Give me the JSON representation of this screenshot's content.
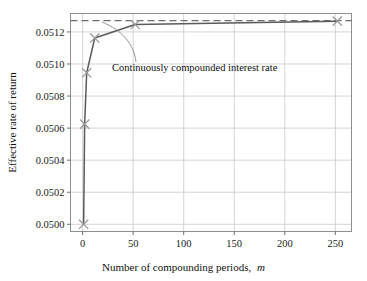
{
  "chart_data": {
    "type": "line",
    "title": "",
    "xlabel": "Number of compounding periods, m",
    "xlabel_main": "Number of compounding periods,",
    "xlabel_italic": "m",
    "ylabel": "Effective rate of return",
    "xlim": [
      -12,
      266
    ],
    "ylim": [
      0.049955,
      0.051315
    ],
    "grid": true,
    "legend": "none",
    "xticks": [
      0,
      50,
      100,
      150,
      200,
      250
    ],
    "xticklabels": [
      "0",
      "50",
      "100",
      "150",
      "200",
      "250"
    ],
    "yticks": [
      0.05,
      0.0502,
      0.0504,
      0.0506,
      0.0508,
      0.051,
      0.0512
    ],
    "yticklabels": [
      "0.0500",
      "0.0502",
      "0.0504",
      "0.0506",
      "0.0508",
      "0.0510",
      "0.0512"
    ],
    "series": [
      {
        "name": "Effective rate of return",
        "marker": "x",
        "x": [
          1,
          2,
          4,
          12,
          52,
          252
        ],
        "values": [
          0.05,
          0.050625,
          0.050945,
          0.051162,
          0.051246,
          0.0512674
        ]
      }
    ],
    "reference_line": {
      "name": "Continuously compounded interest rate",
      "style": "dashed",
      "y": 0.0512711
    },
    "annotations": [
      {
        "text": "Continuously compounded interest rate",
        "x": 33,
        "y": 0.051038
      }
    ],
    "colors": {
      "line": "#5a5a5a",
      "marker": "#9a9a9a",
      "dashed": "#6d6d6d",
      "grid": "#c9c9c9",
      "frame": "#8f8f8f",
      "text": "#1c1c1c",
      "background": "#ffffff"
    }
  }
}
